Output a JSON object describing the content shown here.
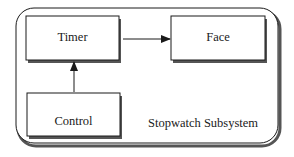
{
  "diagram": {
    "subsystem": {
      "label": "Stopwatch Subsystem"
    },
    "components": [
      {
        "id": "timer",
        "label": "Timer"
      },
      {
        "id": "face",
        "label": "Face"
      },
      {
        "id": "control",
        "label": "Control"
      }
    ],
    "connections": [
      {
        "from": "Timer",
        "to": "Face",
        "type": "arrow"
      },
      {
        "from": "Control",
        "to": "Timer",
        "type": "arrow"
      }
    ],
    "colors": {
      "stroke": "#1a1a1a",
      "shadow": "#555555",
      "background": "#ffffff"
    }
  }
}
